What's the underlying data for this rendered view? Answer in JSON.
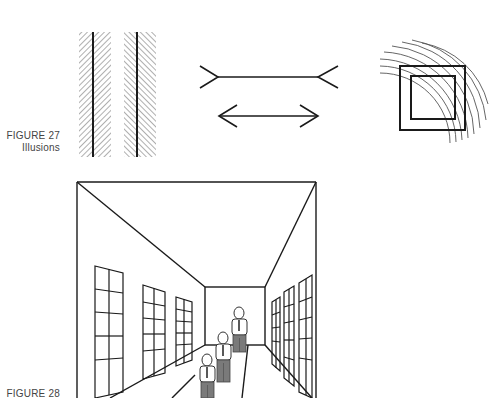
{
  "figures": [
    {
      "id": "figure-27",
      "label": "FIGURE 27",
      "caption": "Illusions",
      "panels": [
        {
          "name": "zollner-parallel-lines",
          "description": "Two parallel vertical lines on opposing diagonal hatching"
        },
        {
          "name": "muller-lyer-arrows",
          "description": "Two equal horizontal lines with outward and inward fins"
        },
        {
          "name": "concentric-arcs-squares",
          "description": "Two nested squares overlaid with concentric arcs"
        }
      ]
    },
    {
      "id": "figure-28",
      "label": "FIGURE 28",
      "caption": "",
      "panels": [
        {
          "name": "corridor-perspective",
          "description": "Perspective hallway with windows and three figures of equal drawn size"
        }
      ]
    }
  ],
  "colors": {
    "ink": "#1a1a1a",
    "hatch": "#9a9a9a",
    "arcs": "#555555",
    "figure_gray": "#7a7a7a",
    "caption": "#444444"
  }
}
